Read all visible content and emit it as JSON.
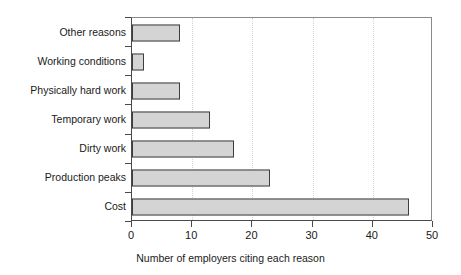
{
  "chart_data": {
    "type": "bar",
    "orientation": "horizontal",
    "title": "",
    "xlabel": "Number of employers citing each reason",
    "ylabel": "",
    "categories": [
      "Other reasons",
      "Working conditions",
      "Physically hard work",
      "Temporary work",
      "Dirty work",
      "Production peaks",
      "Cost"
    ],
    "values": [
      8,
      2,
      8,
      13,
      17,
      23,
      46
    ],
    "xlim": [
      0,
      50
    ],
    "xticks": [
      0,
      10,
      20,
      30,
      40,
      50
    ],
    "xtick_labels": [
      "0",
      "10",
      "20",
      "30",
      "40",
      "50"
    ],
    "gridlines": [
      10,
      20,
      30,
      40
    ],
    "grid": true,
    "legend": false,
    "colors": {
      "bar_fill": "#d4d4d4",
      "bar_border": "#3d3d3d",
      "axis": "#4a4a4a",
      "gridline": "#d2d2d2",
      "text": "#1a1a1a",
      "background": "#ffffff"
    }
  }
}
